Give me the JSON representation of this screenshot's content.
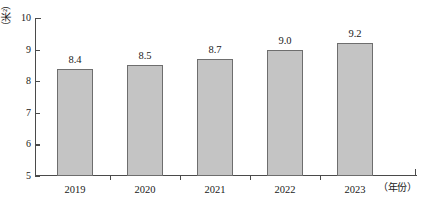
{
  "chart_data": {
    "type": "bar",
    "title": "",
    "categories": [
      "2019",
      "2020",
      "2021",
      "2022",
      "2023"
    ],
    "values": [
      8.4,
      8.5,
      8.7,
      9.0,
      9.2
    ],
    "data_labels": [
      "8.4",
      "8.5",
      "8.7",
      "9.0",
      "9.2"
    ],
    "xlabel": "（年份）",
    "ylabel": "（米²）",
    "ylim": [
      5,
      10
    ],
    "y_ticks": [
      10,
      9,
      8,
      7,
      6,
      5
    ],
    "y_tick_labels": [
      "10",
      "9",
      "8",
      "7",
      "6",
      "5"
    ],
    "grid": false,
    "legend": null,
    "bar_fill_color": "#c4c4c4",
    "bar_border_color": "#6e6e6e",
    "axis_color": "#4a4a4a"
  }
}
